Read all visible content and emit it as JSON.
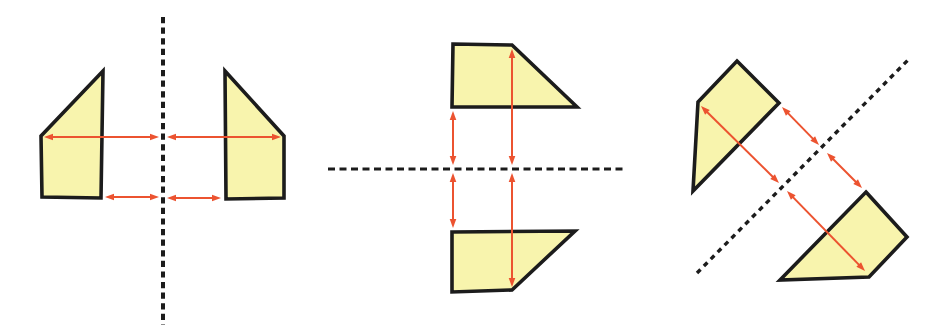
{
  "colors": {
    "background": "#ffffff",
    "shape_fill": "#f8f4ad",
    "shape_outline": "#1c1c1c",
    "mirror_line": "#1c1c1c",
    "arrow": "#ec5330"
  },
  "style": {
    "shape_stroke_width": 3.6,
    "arrow_shaft_width": 2,
    "arrow_head_length": 9,
    "arrow_head_half_width": 3.3
  },
  "panels": [
    {
      "name": "vertical-mirror",
      "mirror_line": {
        "x1": 163,
        "y1": 17,
        "x2": 163,
        "y2": 325,
        "width": 4,
        "dash": "6.2 4.4"
      },
      "shapes": [
        {
          "name": "left-trapezoid",
          "points": [
            [
              103,
              71
            ],
            [
              41,
              136
            ],
            [
              42,
              197
            ],
            [
              101,
              198
            ]
          ]
        },
        {
          "name": "right-trapezoid",
          "points": [
            [
              225,
              71
            ],
            [
              284,
              136
            ],
            [
              284,
              198
            ],
            [
              226,
              199
            ]
          ]
        }
      ],
      "arrows": [
        {
          "x1": 44,
          "y1": 137,
          "x2": 159,
          "y2": 137
        },
        {
          "x1": 167,
          "y1": 137,
          "x2": 281,
          "y2": 137
        },
        {
          "x1": 105,
          "y1": 197,
          "x2": 159,
          "y2": 197
        },
        {
          "x1": 167,
          "y1": 198,
          "x2": 221,
          "y2": 198
        }
      ]
    },
    {
      "name": "horizontal-mirror",
      "mirror_line": {
        "x1": 328,
        "y1": 169,
        "x2": 627,
        "y2": 169,
        "width": 3.2,
        "dash": "7 4.5"
      },
      "shapes": [
        {
          "name": "top-trapezoid",
          "points": [
            [
              453,
              44
            ],
            [
              512,
              45
            ],
            [
              577,
              107
            ],
            [
              452,
              107
            ]
          ]
        },
        {
          "name": "bottom-trapezoid",
          "points": [
            [
              452,
              232
            ],
            [
              575,
              231
            ],
            [
              512,
              290
            ],
            [
              452,
              292
            ]
          ]
        }
      ],
      "arrows": [
        {
          "x1": 453,
          "y1": 111,
          "x2": 453,
          "y2": 165
        },
        {
          "x1": 453,
          "y1": 173,
          "x2": 453,
          "y2": 228
        },
        {
          "x1": 512,
          "y1": 49,
          "x2": 512,
          "y2": 165
        },
        {
          "x1": 512,
          "y1": 173,
          "x2": 512,
          "y2": 287
        }
      ]
    },
    {
      "name": "diagonal-mirror",
      "mirror_line": {
        "x1": 697,
        "y1": 273,
        "x2": 908,
        "y2": 60,
        "width": 3.4,
        "dash": "5 4.8"
      },
      "shapes": [
        {
          "name": "upper-trapezoid",
          "points": [
            [
              737,
              61
            ],
            [
              779,
              103
            ],
            [
              693,
              191
            ],
            [
              698,
              102
            ]
          ]
        },
        {
          "name": "lower-trapezoid",
          "points": [
            [
              866,
              192
            ],
            [
              907,
              237
            ],
            [
              869,
              277
            ],
            [
              780,
              280
            ]
          ]
        }
      ],
      "arrows": [
        {
          "x1": 701,
          "y1": 106,
          "x2": 779,
          "y2": 183
        },
        {
          "x1": 787,
          "y1": 191,
          "x2": 865,
          "y2": 271
        },
        {
          "x1": 782,
          "y1": 107,
          "x2": 819,
          "y2": 145
        },
        {
          "x1": 827,
          "y1": 153,
          "x2": 862,
          "y2": 188
        }
      ]
    }
  ]
}
